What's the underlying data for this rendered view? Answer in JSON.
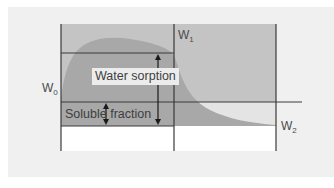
{
  "diagram": {
    "type": "water sorption / solubility weight curve",
    "colors": {
      "background": "#ffffff",
      "panel": "#f0f0f0",
      "upper_band": "#c4c4c4",
      "curve_fill": "#a8a8a8",
      "lower_band": "#ffffff",
      "lines": "#3a3a3a"
    },
    "labels": {
      "w0": {
        "main": "W",
        "sub": "0"
      },
      "w1": {
        "main": "W",
        "sub": "1"
      },
      "w2": {
        "main": "W",
        "sub": "2"
      },
      "water_sorption": "Water sorption",
      "soluble_fraction": "Soluble fraction"
    },
    "geometry": {
      "frame_left_x": 61,
      "frame_mid_x": 174,
      "frame_right_x": 276,
      "top_y": 24,
      "w1_line_y": 53,
      "w2_line_y": 102,
      "w2_line_end_x": 302,
      "solubility_line_y": 126,
      "bottom_y": 151
    }
  }
}
